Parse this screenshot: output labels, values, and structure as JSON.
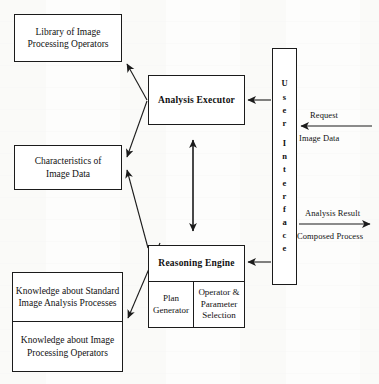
{
  "diagram": {
    "nodes": {
      "library": "Library of Image\nProcessing Operators",
      "characteristics": "Characteristics of\nImage Data",
      "knowledge_standard": "Knowledge about Standard\nImage Analysis Processes",
      "knowledge_operators": "Knowledge about Image\nProcessing Operators",
      "analysis_executor": "Analysis Executor",
      "reasoning_engine": "Reasoning Engine",
      "plan_generator": "Plan\nGenerator",
      "operator_parameter_selection": "Operator &\nParameter\nSelection"
    },
    "user_interface": {
      "label": "User Interface",
      "letters": [
        "U",
        "s",
        "e",
        "r",
        "",
        "I",
        "n",
        "t",
        "e",
        "r",
        "f",
        "a",
        "c",
        "e"
      ]
    },
    "edge_labels": {
      "request": "Request",
      "image_data": "Image Data",
      "analysis_result": "Analysis Result",
      "composed_process": "Composed Process"
    },
    "colors": {
      "stroke": "#1b1b1b",
      "fill": "#ffffff",
      "text": "#111111"
    }
  }
}
